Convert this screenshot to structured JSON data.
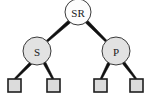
{
  "figure": {
    "kind": "binary-tree-diagram",
    "background_color": "#ffffff",
    "width": 154,
    "height": 108
  },
  "palette": {
    "edge_color": "#111111",
    "node_stroke": "#3a3a3a",
    "root_fill": "#fdfdfd",
    "inner_fill": "#e2e2e2",
    "leaf_fill": "#dcdcdc",
    "leaf_stroke": "#1f1f1f",
    "text_color": "#1a1a1a"
  },
  "tree": {
    "nodes": [
      {
        "id": "root",
        "label": "SR",
        "shape": "circle",
        "cx": 78,
        "cy": 12,
        "r": 13,
        "fill": "#fdfdfd",
        "name": "node-sr"
      },
      {
        "id": "left",
        "label": "S",
        "shape": "circle",
        "cx": 37,
        "cy": 51,
        "r": 14,
        "fill": "#e2e2e2",
        "name": "node-s"
      },
      {
        "id": "right",
        "label": "P",
        "shape": "circle",
        "cx": 116,
        "cy": 51,
        "r": 14,
        "fill": "#e2e2e2",
        "name": "node-p"
      }
    ],
    "leaves": [
      {
        "id": "leaf1",
        "label": "",
        "shape": "square",
        "x": 8,
        "y": 79,
        "size": 13,
        "name": "leaf-node-1"
      },
      {
        "id": "leaf2",
        "label": "",
        "shape": "square",
        "x": 47,
        "y": 79,
        "size": 13,
        "name": "leaf-node-2"
      },
      {
        "id": "leaf3",
        "label": "",
        "shape": "square",
        "x": 94,
        "y": 79,
        "size": 13,
        "name": "leaf-node-3"
      },
      {
        "id": "leaf4",
        "label": "",
        "shape": "square",
        "x": 130,
        "y": 79,
        "size": 13,
        "name": "leaf-node-4"
      }
    ],
    "edges": [
      {
        "id": "e-root-left",
        "from": "root",
        "to": "left",
        "x1": 70,
        "y1": 21,
        "x2": 45,
        "y2": 43,
        "width_from": 3.4,
        "width_to": 2.0,
        "name": "edge-sr-to-s"
      },
      {
        "id": "e-root-right",
        "from": "root",
        "to": "right",
        "x1": 86,
        "y1": 21,
        "x2": 108,
        "y2": 43,
        "width_from": 3.4,
        "width_to": 2.0,
        "name": "edge-sr-to-p"
      },
      {
        "id": "e-left-leaf1",
        "from": "left",
        "to": "leaf1",
        "x1": 31,
        "y1": 63,
        "x2": 15,
        "y2": 79,
        "width_from": 3.0,
        "width_to": 1.8,
        "name": "edge-s-to-leaf-1"
      },
      {
        "id": "e-left-leaf2",
        "from": "left",
        "to": "leaf2",
        "x1": 44,
        "y1": 62,
        "x2": 53,
        "y2": 79,
        "width_from": 3.0,
        "width_to": 1.8,
        "name": "edge-s-to-leaf-2"
      },
      {
        "id": "e-right-leaf3",
        "from": "right",
        "to": "leaf3",
        "x1": 109,
        "y1": 63,
        "x2": 101,
        "y2": 79,
        "width_from": 3.0,
        "width_to": 1.8,
        "name": "edge-p-to-leaf-3"
      },
      {
        "id": "e-right-leaf4",
        "from": "right",
        "to": "leaf4",
        "x1": 123,
        "y1": 62,
        "x2": 136,
        "y2": 79,
        "width_from": 3.0,
        "width_to": 1.8,
        "name": "edge-p-to-leaf-4"
      }
    ]
  }
}
